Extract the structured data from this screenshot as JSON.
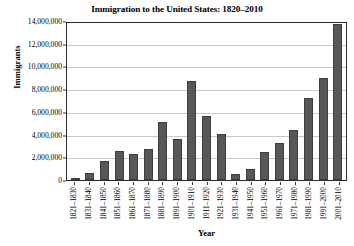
{
  "chart_data": {
    "type": "bar",
    "title": "Immigration to the United States: 1820–2010",
    "xlabel": "Year",
    "ylabel": "Immigrants",
    "ylim": [
      0,
      14000000
    ],
    "ytick_step": 2000000,
    "grid": true,
    "legend": "none",
    "bar_color": "#575757",
    "categories": [
      "1821–1830",
      "1831–1840",
      "1841–1850",
      "1851–1860",
      "1861–1870",
      "1871–1880",
      "1881–1890",
      "1891–1900",
      "1901–1910",
      "1911–1920",
      "1921–1930",
      "1931–1940",
      "1941–1950",
      "1951–1960",
      "1961–1970",
      "1971–1980",
      "1981–1990",
      "1991–2000",
      "2001–2010"
    ],
    "values": [
      150000,
      600000,
      1700000,
      2600000,
      2300000,
      2800000,
      5200000,
      3700000,
      8800000,
      5700000,
      4100000,
      500000,
      1000000,
      2500000,
      3300000,
      4500000,
      7300000,
      9100000,
      13900000
    ],
    "ytick_labels": [
      "0",
      "2,000,000",
      "4,000,000",
      "6,000,000",
      "8,000,000",
      "10,000,000",
      "12,000,000",
      "14,000,000"
    ],
    "ytick_values": [
      0,
      2000000,
      4000000,
      6000000,
      8000000,
      10000000,
      12000000,
      14000000
    ]
  }
}
